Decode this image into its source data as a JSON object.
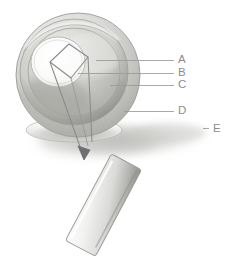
{
  "figure": {
    "style": "graphite pencil scientific illustration",
    "background_color": "#ffffff",
    "ink_color": "#8c8c90",
    "width_px": 233,
    "height_px": 270
  },
  "labels": {
    "a": "A",
    "b": "B",
    "c": "C",
    "d": "D",
    "e": "E"
  },
  "leaders": {
    "a": {
      "x1": 96,
      "y1": 60,
      "x2": 174,
      "y2": 60
    },
    "b": {
      "x1": 78,
      "y1": 73,
      "x2": 174,
      "y2": 73
    },
    "c": {
      "x1": 110,
      "y1": 85,
      "x2": 174,
      "y2": 85
    },
    "d": {
      "x1": 124,
      "y1": 111,
      "x2": 174,
      "y2": 111
    },
    "e": {
      "x1": 203,
      "y1": 128,
      "x2": 210,
      "y2": 128
    }
  },
  "shapes": {
    "sphere": {
      "cx": 78,
      "cy": 75,
      "r": 62,
      "tone": "#d8d8d6"
    },
    "outer_rim": {
      "tone": "#b9b9b7"
    },
    "mid_layer": {
      "cx": 74,
      "cy": 72,
      "rx": 46,
      "ry": 44,
      "tone": "#c9c9c6"
    },
    "core_cavity": {
      "cx": 58,
      "cy": 62,
      "rx": 26,
      "ry": 24,
      "tone": "#fbfbfb"
    },
    "inner_square": {
      "tone": "#8f8f92"
    },
    "ground_shadow": {
      "cx": 116,
      "cy": 140,
      "rx": 86,
      "ry": 20,
      "tone": "#cfcfcd"
    },
    "slab": {
      "tone_light": "#fdfdfd",
      "tone_dark": "#9a9a98",
      "rotation_deg": -62
    },
    "arrow": {
      "tip_x": 84,
      "tip_y": 159,
      "tone": "#7d7d80"
    }
  }
}
